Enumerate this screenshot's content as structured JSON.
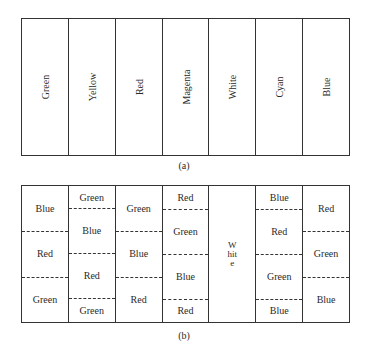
{
  "figure_a": {
    "caption": "(a)",
    "columns": [
      "Green",
      "Yellow",
      "Red",
      "Magenta",
      "White",
      "Cyan",
      "Blue"
    ]
  },
  "figure_b": {
    "caption": "(b)",
    "columns": [
      {
        "segments": [
          "Blue",
          "Red",
          "Green"
        ]
      },
      {
        "segments": [
          "Green",
          "Blue",
          "Red",
          "Green"
        ],
        "fractions": [
          0.165,
          0.33,
          0.33,
          0.175
        ]
      },
      {
        "segments": [
          "Green",
          "Blue",
          "Red"
        ]
      },
      {
        "segments": [
          "Red",
          "Green",
          "Blue",
          "Red"
        ],
        "fractions": [
          0.17,
          0.33,
          0.33,
          0.17
        ]
      },
      {
        "vertical_text": "White"
      },
      {
        "segments": [
          "Blue",
          "Red",
          "Green",
          "Blue"
        ],
        "fractions": [
          0.17,
          0.33,
          0.33,
          0.17
        ]
      },
      {
        "segments": [
          "Red",
          "Green",
          "Blue"
        ]
      }
    ]
  }
}
